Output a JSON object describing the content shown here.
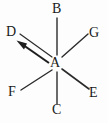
{
  "figure": {
    "type": "chemical-structure-diagram",
    "width": 108,
    "height": 123,
    "background_color": "#fdfdfd",
    "stroke_color": "#2b2b2b",
    "label_color": "#1a1a1a",
    "center": {
      "label": "A",
      "x": 56,
      "y": 63
    },
    "labels": [
      {
        "id": "B",
        "text": "B",
        "x": 52,
        "y": 2,
        "position": "top"
      },
      {
        "id": "G",
        "text": "G",
        "x": 89,
        "y": 26,
        "position": "top-right"
      },
      {
        "id": "D",
        "text": "D",
        "x": 6,
        "y": 25,
        "position": "top-left"
      },
      {
        "id": "A",
        "text": "A",
        "x": 50,
        "y": 56,
        "position": "center"
      },
      {
        "id": "F",
        "text": "F",
        "x": 8,
        "y": 85,
        "position": "bottom-left"
      },
      {
        "id": "E",
        "text": "E",
        "x": 89,
        "y": 86,
        "position": "bottom-right"
      },
      {
        "id": "C",
        "text": "C",
        "x": 52,
        "y": 103,
        "position": "bottom"
      }
    ],
    "bonds": [
      {
        "id": "A-B",
        "from": "A",
        "to": "B",
        "x1": 57,
        "y1": 55,
        "x2": 57,
        "y2": 18,
        "style": "line"
      },
      {
        "id": "A-G",
        "from": "A",
        "to": "G",
        "x1": 62,
        "y1": 57,
        "x2": 88,
        "y2": 34,
        "style": "line"
      },
      {
        "id": "A-D",
        "from": "A",
        "to": "D",
        "x1": 52,
        "y1": 57,
        "x2": 20,
        "y2": 34,
        "style": "line"
      },
      {
        "id": "A-F",
        "from": "A",
        "to": "F",
        "x1": 52,
        "y1": 70,
        "x2": 21,
        "y2": 90,
        "style": "line"
      },
      {
        "id": "A-E",
        "from": "A",
        "to": "E",
        "x1": 62,
        "y1": 69,
        "x2": 89,
        "y2": 89,
        "style": "line"
      },
      {
        "id": "A-C",
        "from": "A",
        "to": "C",
        "x1": 57,
        "y1": 72,
        "x2": 57,
        "y2": 104,
        "style": "line"
      }
    ],
    "arrow": {
      "id": "arrow-to-D",
      "description": "bold arrow pointing from near A up-left toward D",
      "x1": 49,
      "y1": 63,
      "x2": 19,
      "y2": 42,
      "head": "solid-triangle"
    }
  }
}
